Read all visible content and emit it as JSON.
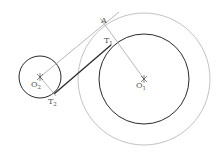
{
  "diagram": {
    "points": {
      "O1": {
        "label": "O",
        "sub": "1"
      },
      "O2": {
        "label": "O",
        "sub": "2"
      },
      "T1": {
        "label": "T",
        "sub": "1"
      },
      "T2": {
        "label": "T",
        "sub": "2"
      },
      "A": {
        "label": "A",
        "sub": ""
      }
    },
    "colors": {
      "thin": "#9a9a9a",
      "thick": "#2a2a2a",
      "label": "#555555"
    }
  }
}
